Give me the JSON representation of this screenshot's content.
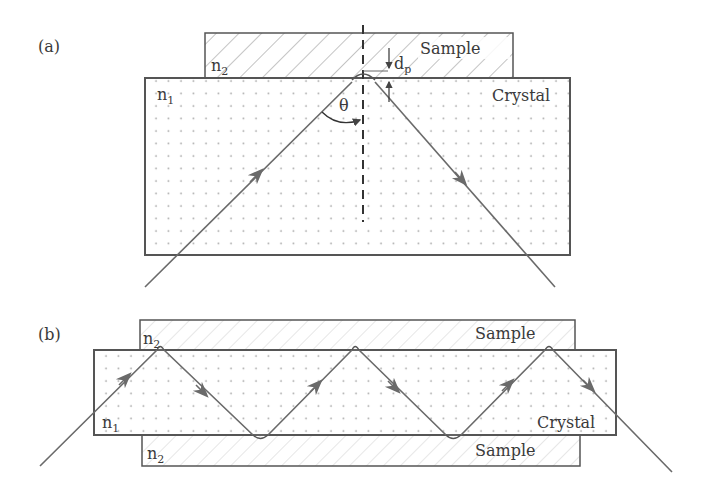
{
  "panel_a": {
    "label": "(a)",
    "sample_label": "Sample",
    "crystal_label": "Crystal",
    "n1": "n",
    "n1_sub": "1",
    "n2": "n",
    "n2_sub": "2",
    "angle_label": "θ",
    "depth_label": "d",
    "depth_sub": "p"
  },
  "panel_b": {
    "label": "(b)",
    "sample_top_label": "Sample",
    "sample_bottom_label": "Sample",
    "crystal_label": "Crystal",
    "n1": "n",
    "n1_sub": "1",
    "n2_top": "n",
    "n2_top_sub": "2",
    "n2_bottom": "n",
    "n2_bottom_sub": "2"
  },
  "colors": {
    "line": "#555555",
    "ray": "#6a6a6a",
    "hatch": "#9a9a9a",
    "dots": "#b0b0b0"
  }
}
